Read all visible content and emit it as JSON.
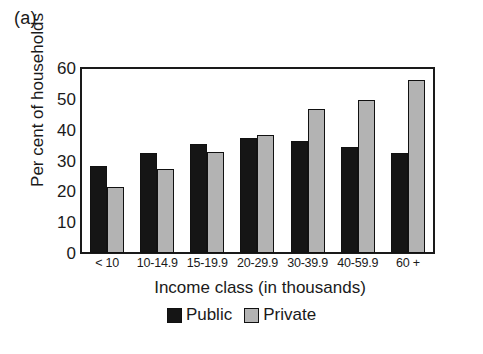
{
  "panel": {
    "label": "(a)"
  },
  "legend": {
    "position": "bottom-center",
    "entries": [
      {
        "name": "Public",
        "swatch": "black-square-icon",
        "color": "#151515"
      },
      {
        "name": "Private",
        "swatch": "gray-square-icon",
        "color": "#b3b3b3"
      }
    ]
  },
  "chart_data": {
    "type": "bar",
    "title": "",
    "xlabel": "Income class (in thousands)",
    "ylabel": "Per cent of households",
    "categories": [
      "< 10",
      "10-14.9",
      "15-19.9",
      "20-29.9",
      "30-39.9",
      "40-59.9",
      "60 +"
    ],
    "series": [
      {
        "name": "Public",
        "color": "#151515",
        "values": [
          28.5,
          32.5,
          35.5,
          37.5,
          36.5,
          34.5,
          32.5
        ]
      },
      {
        "name": "Private",
        "color": "#b3b3b3",
        "values": [
          21.5,
          27.5,
          33.0,
          38.5,
          47.0,
          50.0,
          56.5
        ]
      }
    ],
    "ylim": [
      0,
      60
    ],
    "yticks": [
      0,
      10,
      20,
      30,
      40,
      50,
      60
    ],
    "grid": false,
    "legend_position": "bottom-center"
  }
}
